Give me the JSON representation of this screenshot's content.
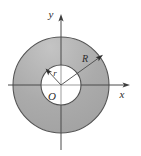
{
  "figure": {
    "type": "geometry-diagram",
    "background_color": "#ffffff",
    "canvas": {
      "width": 141,
      "height": 156
    }
  },
  "labels": {
    "y_axis": "y",
    "x_axis": "x",
    "origin": "O",
    "outer_radius": "R",
    "inner_radius": "r"
  },
  "geometry": {
    "center": {
      "x": 61,
      "y": 85
    },
    "outer_radius": 48,
    "inner_radius": 20,
    "annulus_fill": "#a8a8a8",
    "annulus_fill_light": "#c2c2c2",
    "annulus_fill_dark": "#9a9a9a",
    "inner_fill": "#ffffff",
    "outline_color": "#555555",
    "axis_color": "#4a4a4a"
  },
  "axes": {
    "y_axis_top": 18,
    "y_axis_bottom": 150,
    "x_axis_left": 8,
    "x_axis_right": 126,
    "y_label_position": {
      "x": 51,
      "y": 17
    },
    "x_label_position": {
      "x": 120,
      "y": 97
    },
    "origin_label_position": {
      "x": 52,
      "y": 99
    }
  },
  "leaders": {
    "outer_radius_line": {
      "x1": 61,
      "y1": 85,
      "x2": 100,
      "y2": 57
    },
    "outer_radius_label_position": {
      "x": 84,
      "y": 62
    },
    "inner_radius_line": {
      "x1": 61,
      "y1": 85,
      "x2": 47,
      "y2": 70
    },
    "inner_radius_label_position": {
      "x": 54,
      "y": 75
    }
  }
}
